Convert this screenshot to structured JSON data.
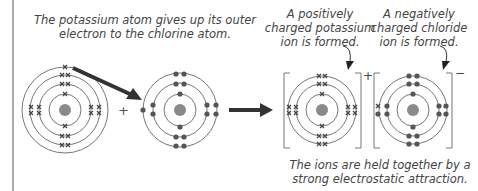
{
  "captions": {
    "transfer": [
      "The potassium atom gives up its outer",
      "electron to the chlorine atom."
    ],
    "k_ion": [
      "A positively",
      "charged potassium",
      "ion is formed."
    ],
    "cl_ion": [
      "A negatively",
      "charged chloride",
      "ion is formed."
    ],
    "bond": [
      "The ions are held together by a",
      "strong electrostatic attraction."
    ]
  },
  "symbols": {
    "plus": "+",
    "ion_plus": "+",
    "ion_minus": "−"
  },
  "colors": {
    "ring": "#555555",
    "nucleus": "#8a8a8a",
    "electron": "#555555",
    "arrow": "#333333",
    "text": "#444444",
    "border": "#aaaaaa"
  }
}
